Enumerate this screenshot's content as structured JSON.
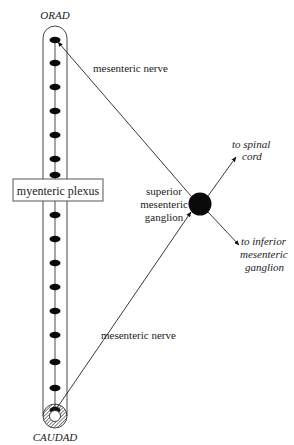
{
  "labels": {
    "orad": "ORAD",
    "caudad": "CAUDAD",
    "myenteric_plexus": "myenteric plexus",
    "mesenteric_nerve_upper": "mesenteric nerve",
    "mesenteric_nerve_lower": "mesenteric nerve",
    "ganglion_line1": "superior",
    "ganglion_line2": "mesenteric",
    "ganglion_line3": "ganglion",
    "spinal_line1": "to spinal",
    "spinal_line2": "cord",
    "inferior_line1": "to inferior",
    "inferior_line2": "mesenteric",
    "inferior_line3": "ganglion"
  },
  "plexus": {
    "node_count": 16,
    "arrow_direction": "orad"
  },
  "colors": {
    "ink": "#111111",
    "text": "#222222",
    "background": "#ffffff"
  }
}
